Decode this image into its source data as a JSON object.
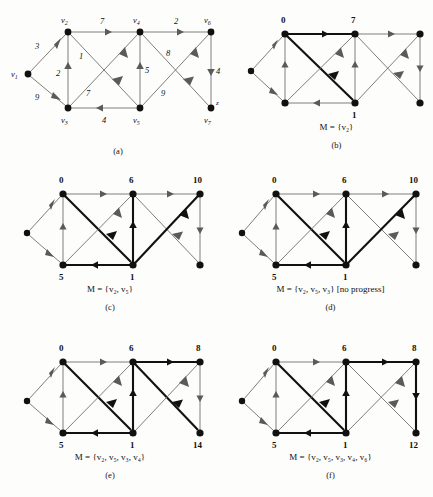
{
  "figure": {
    "type": "algorithm-trace-diagram"
  },
  "graph": {
    "vertices": [
      {
        "id": "v1",
        "label": "v",
        "sub": "1",
        "x": 28,
        "y": 70
      },
      {
        "id": "v2",
        "label": "v",
        "sub": "2",
        "x": 68,
        "y": 28
      },
      {
        "id": "v3",
        "label": "v",
        "sub": "3",
        "x": 68,
        "y": 104
      },
      {
        "id": "v4",
        "label": "v",
        "sub": "4",
        "x": 140,
        "y": 28
      },
      {
        "id": "v5",
        "label": "v",
        "sub": "5",
        "x": 140,
        "y": 104
      },
      {
        "id": "v6",
        "label": "v",
        "sub": "6",
        "x": 211,
        "y": 28
      },
      {
        "id": "v7",
        "label": "v",
        "sub": "7",
        "x": 211,
        "y": 104
      }
    ],
    "sink_label": "z",
    "edges": [
      {
        "from": "v1",
        "to": "v2",
        "weight": "3"
      },
      {
        "from": "v1",
        "to": "v3",
        "weight": "9"
      },
      {
        "from": "v3",
        "to": "v2",
        "weight": "2"
      },
      {
        "from": "v2",
        "to": "v4",
        "weight": "7"
      },
      {
        "from": "v2",
        "to": "v5",
        "weight": "1"
      },
      {
        "from": "v3",
        "to": "v4",
        "weight": "7"
      },
      {
        "from": "v5",
        "to": "v3",
        "weight": "4"
      },
      {
        "from": "v5",
        "to": "v4",
        "weight": "5"
      },
      {
        "from": "v4",
        "to": "v6",
        "weight": "2"
      },
      {
        "from": "v4",
        "to": "v7",
        "weight": "8"
      },
      {
        "from": "v5",
        "to": "v6",
        "weight": "9"
      },
      {
        "from": "v6",
        "to": "v7",
        "weight": "4"
      }
    ]
  },
  "panels": [
    {
      "id": "b",
      "caption": "(b)",
      "m_label": "M = {v₂}",
      "distances": {
        "v2": "0",
        "v4": "7",
        "v5": "1"
      },
      "bold_edges": [
        "v2-v4",
        "v2-v5"
      ]
    },
    {
      "id": "c",
      "caption": "(c)",
      "m_label": "M = {v₂, v₅}",
      "distances": {
        "v2": "0",
        "v3": "5",
        "v4": "6",
        "v5": "1",
        "v6": "10"
      },
      "bold_edges": [
        "v2-v5",
        "v5-v3",
        "v5-v4",
        "v5-v6"
      ]
    },
    {
      "id": "d",
      "caption": "(d)",
      "m_label": "M = {v₂, v₅, v₃} [no progress]",
      "distances": {
        "v2": "0",
        "v3": "5",
        "v4": "6",
        "v5": "1",
        "v6": "10"
      },
      "bold_edges": [
        "v2-v5",
        "v5-v3",
        "v5-v4",
        "v5-v6"
      ]
    },
    {
      "id": "e",
      "caption": "(e)",
      "m_label": "M = {v₂, v₅, v₃, v₄}",
      "distances": {
        "v2": "0",
        "v3": "5",
        "v4": "6",
        "v5": "1",
        "v6": "8",
        "v7": "14"
      },
      "bold_edges": [
        "v2-v5",
        "v5-v3",
        "v5-v4",
        "v4-v6",
        "v4-v7"
      ]
    },
    {
      "id": "f",
      "caption": "(f)",
      "m_label": "M = {v₂, v₅, v₃, v₄, v₆}",
      "distances": {
        "v2": "0",
        "v3": "5",
        "v4": "6",
        "v5": "1",
        "v6": "8",
        "v7": "12"
      },
      "bold_edges": [
        "v2-v5",
        "v5-v3",
        "v5-v4",
        "v4-v6",
        "v6-v7"
      ]
    }
  ],
  "panel_a": {
    "id": "a",
    "caption": "(a)",
    "weights": {
      "v1-v2": "3",
      "v1-v3": "9",
      "v3-v2": "2",
      "v2-v4": "7",
      "v2-v5": "1",
      "v3-v4": "7",
      "v5-v3": "4",
      "v5-v4": "5",
      "v4-v6": "2",
      "v4-v7": "8",
      "v5-v6": "9",
      "v6-v7": "4"
    }
  },
  "colors": {
    "edge": "#6f6f6f",
    "edge_bold": "#111111",
    "node": "#111111",
    "background": "#fdfdfb"
  }
}
